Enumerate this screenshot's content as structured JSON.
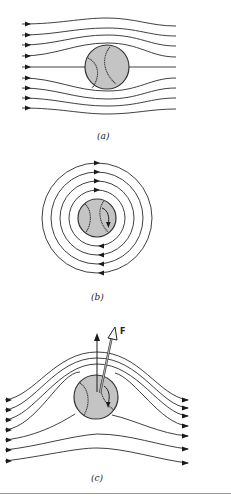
{
  "figure": {
    "panels": [
      {
        "id": "a",
        "label": "(a)",
        "description": "Uniform airflow streamlines passing around a non-spinning baseball"
      },
      {
        "id": "b",
        "label": "(b)",
        "description": "Circulating airflow around a spinning baseball"
      },
      {
        "id": "c",
        "label": "(c)",
        "description": "Combined flow around spinning baseball producing lift force",
        "force_label": "F"
      }
    ],
    "colors": {
      "ball_fill": "#c4c4c4",
      "ball_stroke": "#333333",
      "line": "#2a2a2a",
      "background": "#ffffff",
      "divider": "#999999"
    }
  }
}
